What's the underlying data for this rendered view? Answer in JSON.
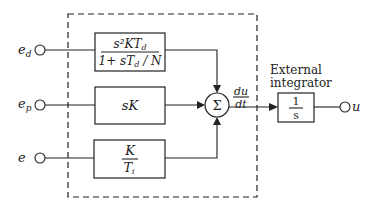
{
  "diagram": {
    "type": "block-diagram",
    "inputs": [
      {
        "id": "ed",
        "label_main": "e",
        "label_sub": "d"
      },
      {
        "id": "ep",
        "label_main": "e",
        "label_sub": "p"
      },
      {
        "id": "e",
        "label_main": "e",
        "label_sub": ""
      }
    ],
    "blocks": {
      "derivative": {
        "numerator": "s²KT",
        "numerator_sub": "d",
        "denominator": "1+ sT",
        "denominator_sub": "d",
        "denominator_tail": " / N"
      },
      "proportional": {
        "text": "sK"
      },
      "integral": {
        "numerator": "K",
        "denominator": "T",
        "denominator_sub": "i"
      },
      "integrator": {
        "numerator": "1",
        "denominator": "s"
      }
    },
    "summing_junction": {
      "symbol": "Σ"
    },
    "sum_output_label": {
      "numerator": "du",
      "denominator": "dt"
    },
    "external_integrator_label": [
      "External",
      "integrator"
    ],
    "output": {
      "label": "u"
    }
  }
}
